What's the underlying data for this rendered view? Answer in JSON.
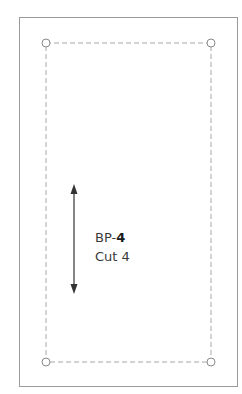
{
  "piece": {
    "prefix": "BP-",
    "number": "4",
    "cut_label": "Cut 4"
  },
  "colors": {
    "outline": "#9a9a9a",
    "seam": "#a8a8a8",
    "arrow": "#333333",
    "text": "#3a3a3a"
  },
  "icons": {
    "grainline": "double-arrow-vertical",
    "corner_marker": "circle"
  }
}
